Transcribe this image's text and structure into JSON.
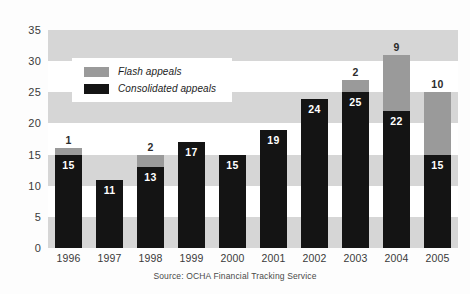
{
  "chart_data": {
    "type": "bar",
    "subtype": "stacked-bar",
    "title": "",
    "subtitle": "",
    "xlabel": "",
    "ylabel": "",
    "categories": [
      "1996",
      "1997",
      "1998",
      "1999",
      "2000",
      "2001",
      "2002",
      "2003",
      "2004",
      "2005"
    ],
    "series": [
      {
        "name": "Consolidated appeals",
        "color": "#141414",
        "values": [
          15,
          11,
          13,
          17,
          15,
          19,
          24,
          25,
          22,
          15
        ],
        "labels": [
          "15",
          "11",
          "13",
          "17",
          "15",
          "19",
          "24",
          "25",
          "22",
          "15"
        ]
      },
      {
        "name": "Flash appeals",
        "color": "#9a9a9a",
        "values": [
          1,
          0,
          2,
          0,
          0,
          0,
          0,
          2,
          9,
          10
        ],
        "labels": [
          "1",
          "",
          "2",
          "",
          "",
          "",
          "",
          "2",
          "9",
          "10"
        ]
      }
    ],
    "totals": [
      16,
      11,
      15,
      17,
      15,
      19,
      24,
      27,
      31,
      25
    ],
    "ylim": [
      0,
      35
    ],
    "yticks": [
      0,
      5,
      10,
      15,
      20,
      25,
      30,
      35
    ],
    "ytick_labels": [
      "0",
      "5",
      "10",
      "15",
      "20",
      "25",
      "30",
      "35"
    ],
    "grid": "alternating-horizontal-bands",
    "band_color": "#d6d6d6",
    "band_interval": 5,
    "legend_position": "upper-left-inside",
    "plot_background": "#ffffff"
  },
  "legend": {
    "items": [
      {
        "label": "Flash appeals",
        "swatch": "flash"
      },
      {
        "label": "Consolidated appeals",
        "swatch": "consolidated"
      }
    ]
  },
  "footer": {
    "source": "Source: OCHA Financial Tracking Service"
  }
}
